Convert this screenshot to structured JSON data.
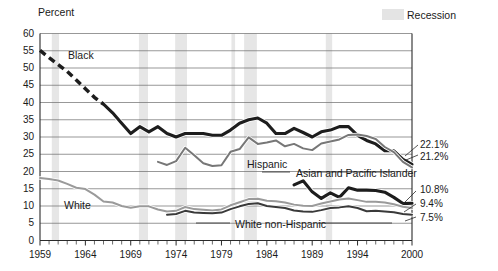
{
  "chart_data": {
    "type": "line",
    "title": "",
    "ylabel": "Percent",
    "xlabel": "",
    "ylim": [
      0,
      60
    ],
    "ytick_values": [
      0,
      5,
      10,
      15,
      20,
      25,
      30,
      35,
      40,
      45,
      50,
      55,
      60
    ],
    "ytick_labels": [
      "0",
      "5",
      "10",
      "15",
      "20",
      "25",
      "30",
      "35",
      "40",
      "45",
      "50",
      "55",
      "60"
    ],
    "xlim": [
      1959,
      2000
    ],
    "xtick_labels": [
      "1959",
      "1964",
      "1969",
      "1974",
      "1979",
      "1984",
      "1989",
      "1994",
      "2000"
    ],
    "xtick_values": [
      1959,
      1964,
      1969,
      1974,
      1979,
      1984,
      1989,
      1994,
      2000
    ],
    "grid": "horizontal",
    "legend_position": "top-right",
    "legend": [
      {
        "label": "Recession",
        "color": "#e2e2e2",
        "type": "band"
      }
    ],
    "recession_bands": [
      {
        "start": 1960.3,
        "end": 1961.1
      },
      {
        "start": 1969.9,
        "end": 1970.9
      },
      {
        "start": 1973.9,
        "end": 1975.2
      },
      {
        "start": 1980.1,
        "end": 1980.5
      },
      {
        "start": 1981.5,
        "end": 1982.9
      },
      {
        "start": 1990.5,
        "end": 1991.2
      }
    ],
    "series": [
      {
        "name": "Black",
        "color": "#1d1d1d",
        "style": "thick",
        "end_label": "22.1%",
        "dashed_segment": [
          1959,
          1966
        ],
        "x": [
          1959,
          1960,
          1961,
          1962,
          1963,
          1964,
          1965,
          1966,
          1967,
          1968,
          1969,
          1970,
          1971,
          1972,
          1973,
          1974,
          1975,
          1976,
          1977,
          1978,
          1979,
          1980,
          1981,
          1982,
          1983,
          1984,
          1985,
          1986,
          1987,
          1988,
          1989,
          1990,
          1991,
          1992,
          1993,
          1994,
          1995,
          1996,
          1997,
          1998,
          1999,
          2000
        ],
        "values": [
          55.1,
          53.0,
          51.0,
          49.0,
          46.5,
          44.0,
          41.5,
          39.5,
          37.0,
          34.0,
          31.0,
          33.0,
          31.5,
          33.0,
          31.0,
          30.0,
          31.0,
          31.0,
          31.0,
          30.5,
          30.5,
          32.0,
          34.0,
          35.0,
          35.5,
          34.0,
          31.0,
          31.0,
          32.5,
          31.3,
          30.0,
          31.5,
          32.0,
          33.0,
          33.0,
          30.5,
          29.0,
          28.0,
          26.0,
          26.0,
          23.5,
          22.1
        ]
      },
      {
        "name": "Hispanic",
        "color": "#777777",
        "style": "medium",
        "end_label": "21.2%",
        "x": [
          1972,
          1973,
          1974,
          1975,
          1976,
          1977,
          1978,
          1979,
          1980,
          1981,
          1982,
          1983,
          1984,
          1985,
          1986,
          1987,
          1988,
          1989,
          1990,
          1991,
          1992,
          1993,
          1994,
          1995,
          1996,
          1997,
          1998,
          1999,
          2000
        ],
        "values": [
          22.8,
          21.9,
          23.0,
          26.9,
          24.7,
          22.4,
          21.6,
          21.8,
          25.7,
          26.5,
          29.9,
          28.0,
          28.4,
          29.0,
          27.3,
          28.0,
          26.7,
          26.2,
          28.1,
          28.7,
          29.3,
          30.6,
          30.7,
          30.3,
          29.4,
          27.1,
          25.6,
          22.8,
          21.2
        ]
      },
      {
        "name": "Asian and Pacific Islander",
        "color": "#1d1d1d",
        "style": "thick",
        "end_label": "10.8%",
        "x": [
          1987,
          1988,
          1989,
          1990,
          1991,
          1992,
          1993,
          1994,
          1995,
          1996,
          1997,
          1998,
          1999,
          2000
        ],
        "values": [
          16.1,
          17.3,
          14.1,
          12.2,
          13.8,
          12.5,
          15.3,
          14.6,
          14.6,
          14.5,
          14.0,
          12.5,
          10.7,
          10.8
        ]
      },
      {
        "name": "White",
        "color": "#9a9a9a",
        "style": "medium",
        "end_label": "9.4%",
        "x": [
          1959,
          1960,
          1961,
          1962,
          1963,
          1964,
          1965,
          1966,
          1967,
          1968,
          1969,
          1970,
          1971,
          1972,
          1973,
          1974,
          1975,
          1976,
          1977,
          1978,
          1979,
          1980,
          1981,
          1982,
          1983,
          1984,
          1985,
          1986,
          1987,
          1988,
          1989,
          1990,
          1991,
          1992,
          1993,
          1994,
          1995,
          1996,
          1997,
          1998,
          1999,
          2000
        ],
        "values": [
          18.1,
          17.8,
          17.4,
          16.4,
          15.3,
          14.9,
          13.3,
          11.3,
          11.0,
          10.0,
          9.5,
          9.9,
          9.9,
          9.0,
          8.4,
          8.6,
          9.7,
          9.1,
          8.9,
          8.7,
          9.0,
          10.2,
          11.1,
          12.0,
          12.1,
          11.5,
          11.4,
          11.0,
          10.4,
          10.1,
          10.0,
          10.7,
          11.3,
          11.9,
          12.2,
          11.7,
          11.2,
          11.2,
          11.0,
          10.5,
          9.8,
          9.4
        ]
      },
      {
        "name": "White non-Hispanic",
        "color": "#3a3a3a",
        "style": "medium",
        "end_label": "7.5%",
        "x": [
          1973,
          1974,
          1975,
          1976,
          1977,
          1978,
          1979,
          1980,
          1981,
          1982,
          1983,
          1984,
          1985,
          1986,
          1987,
          1988,
          1989,
          1990,
          1991,
          1992,
          1993,
          1994,
          1995,
          1996,
          1997,
          1998,
          1999,
          2000
        ],
        "values": [
          7.5,
          7.7,
          8.6,
          8.1,
          8.0,
          7.9,
          8.1,
          9.1,
          9.9,
          10.6,
          10.8,
          10.0,
          9.7,
          9.4,
          8.7,
          8.4,
          8.3,
          8.8,
          9.4,
          9.6,
          9.9,
          9.4,
          8.5,
          8.6,
          8.4,
          8.2,
          7.7,
          7.5
        ]
      }
    ],
    "annotations": [
      {
        "text": "Black",
        "x": 68,
        "y": 50
      },
      {
        "text": "Hispanic",
        "x": 247,
        "y": 159
      },
      {
        "text": "Asian and Pacific Islander",
        "x": 296,
        "y": 168
      },
      {
        "text": "White",
        "x": 64,
        "y": 200
      },
      {
        "text": "White non-Hispanic",
        "x": 235,
        "y": 219
      }
    ],
    "end_labels": [
      {
        "text": "22.1%",
        "value": 22.1
      },
      {
        "text": "21.2%",
        "value": 21.2
      },
      {
        "text": "10.8%",
        "value": 10.8
      },
      {
        "text": "9.4%",
        "value": 9.4
      },
      {
        "text": "7.5%",
        "value": 7.5
      }
    ]
  },
  "axis": {
    "unit_label": "Percent"
  },
  "legend": {
    "recession_label": "Recession"
  }
}
